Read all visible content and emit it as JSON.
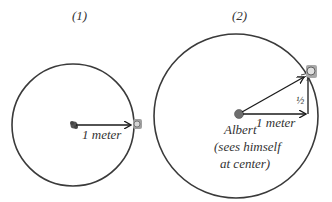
{
  "panels": [
    {
      "title": "(1)",
      "arrow_label": "1 meter"
    },
    {
      "title": "(2)",
      "arrow_label": "1 meter",
      "vertical_label": "½",
      "center_label_lines": [
        "Albert",
        "(sees himself",
        "at center)"
      ]
    }
  ],
  "colors": {
    "circle": "#3a3a3a",
    "arrow": "#1a1a1a",
    "text": "#333333",
    "center_dot": "#6e6e6e",
    "object": "#8a8a8a"
  }
}
